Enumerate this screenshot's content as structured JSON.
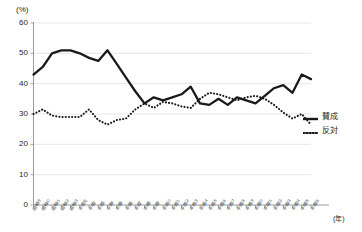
{
  "chart_data": {
    "type": "line",
    "title": "",
    "xlabel": "(年)",
    "ylabel": "(%)",
    "ylim": [
      0,
      60
    ],
    "yticks": [
      0,
      10,
      20,
      30,
      40,
      50,
      60
    ],
    "grid": true,
    "legend_position": "right",
    "categories": [
      "昭和59",
      "昭和60",
      "昭和61",
      "昭和62",
      "昭和63",
      "平成元",
      "平成2",
      "平成3",
      "平成4",
      "平成5",
      "平成6",
      "平成7",
      "平成8",
      "平成9",
      "平成10",
      "平成11",
      "平成12",
      "平成13",
      "平成14",
      "平成15",
      "平成16",
      "平成17",
      "平成18",
      "平成19",
      "平成20",
      "平成21",
      "平成22",
      "平成23",
      "平成24",
      "平成25",
      "平成26"
    ],
    "series": [
      {
        "name": "賛成",
        "style": "solid",
        "color": "#1a1a1a",
        "values": [
          43.0,
          45.5,
          50.0,
          51.0,
          51.0,
          50.0,
          48.5,
          47.5,
          51.0,
          46.5,
          42.0,
          37.5,
          33.5,
          35.5,
          34.5,
          35.5,
          36.5,
          39.0,
          33.5,
          33.0,
          35.0,
          33.0,
          35.5,
          34.5,
          33.5,
          36.0,
          38.5,
          39.5,
          37.0,
          43.0,
          41.5
        ]
      },
      {
        "name": "反対",
        "style": "dotted",
        "color": "#1a1a1a",
        "values": [
          30.0,
          31.5,
          29.5,
          29.0,
          29.0,
          29.0,
          31.5,
          28.0,
          26.5,
          28.0,
          28.5,
          31.5,
          33.5,
          32.0,
          34.0,
          33.5,
          32.5,
          32.0,
          35.0,
          37.0,
          36.5,
          35.5,
          34.5,
          35.5,
          36.0,
          35.0,
          33.0,
          30.5,
          28.5,
          30.0,
          26.5
        ]
      }
    ],
    "annotations": []
  },
  "legend": {
    "items": [
      {
        "label": "賛成",
        "style": "solid"
      },
      {
        "label": "反対",
        "style": "dotted"
      }
    ]
  },
  "axis": {
    "y_unit": "(%)",
    "x_unit": "(年)"
  }
}
